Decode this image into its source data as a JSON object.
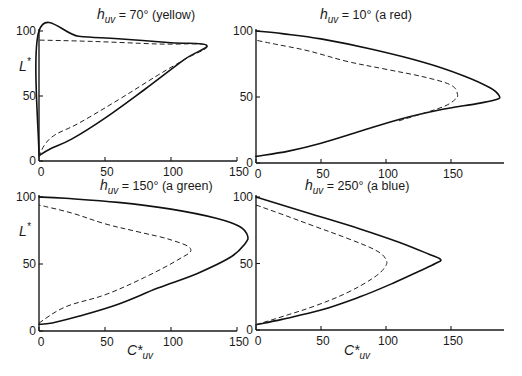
{
  "figure": {
    "panels": [
      {
        "title_symbol": "h",
        "title_sub": "uv",
        "title_rest": " = 70° (yellow)",
        "ylabel": "L",
        "ylabel_sup": "*",
        "xlabel": "",
        "xlabel_sub": ""
      },
      {
        "title_symbol": "h",
        "title_sub": "uv",
        "title_rest": " = 10° (a red)",
        "ylabel": "",
        "ylabel_sup": "",
        "xlabel": "",
        "xlabel_sub": ""
      },
      {
        "title_symbol": "h",
        "title_sub": "uv",
        "title_rest": " = 150° (a green)",
        "ylabel": "L",
        "ylabel_sup": "*",
        "xlabel": "C*",
        "xlabel_sub": "uv"
      },
      {
        "title_symbol": "h",
        "title_sub": "uv",
        "title_rest": " = 250° (a blue)",
        "ylabel": "",
        "ylabel_sup": "",
        "xlabel": "C*",
        "xlabel_sub": "uv"
      }
    ]
  },
  "chart_data": [
    {
      "type": "line",
      "title": "h_uv = 70° (yellow)",
      "xlabel": "",
      "ylabel": "L*",
      "xlim": [
        0,
        150
      ],
      "ylim": [
        0,
        100
      ],
      "xticks": [
        "0",
        "50",
        "100",
        "150"
      ],
      "yticks": [
        "0",
        "50",
        "100"
      ],
      "grid": false,
      "series": [
        {
          "name": "solid boundary",
          "style": "solid",
          "points": [
            [
              0,
              4
            ],
            [
              0,
              100
            ],
            [
              30,
              96
            ],
            [
              60,
              94
            ],
            [
              100,
              91
            ],
            [
              127,
              89
            ],
            [
              110,
              78
            ],
            [
              80,
              55
            ],
            [
              50,
              33
            ],
            [
              25,
              17
            ],
            [
              8,
              9
            ],
            [
              0,
              4
            ]
          ]
        },
        {
          "name": "dashed boundary",
          "style": "dashed",
          "points": [
            [
              0,
              3
            ],
            [
              4,
              12
            ],
            [
              12,
              20
            ],
            [
              30,
              29
            ],
            [
              60,
              47
            ],
            [
              90,
              66
            ],
            [
              110,
              78
            ],
            [
              127,
              89
            ],
            [
              90,
              90
            ],
            [
              40,
              92
            ],
            [
              0,
              93
            ]
          ]
        }
      ]
    },
    {
      "type": "line",
      "title": "h_uv = 10° (a red)",
      "xlabel": "",
      "ylabel": "",
      "xlim": [
        0,
        190
      ],
      "ylim": [
        0,
        100
      ],
      "xticks": [
        "0",
        "50",
        "100",
        "150"
      ],
      "yticks": [
        "0",
        "50",
        "100"
      ],
      "grid": false,
      "series": [
        {
          "name": "solid boundary",
          "style": "solid",
          "points": [
            [
              0,
              5
            ],
            [
              25,
              9
            ],
            [
              50,
              15
            ],
            [
              80,
              24
            ],
            [
              110,
              33
            ],
            [
              140,
              40
            ],
            [
              170,
              45
            ],
            [
              185,
              48
            ],
            [
              187,
              51
            ],
            [
              180,
              57
            ],
            [
              160,
              66
            ],
            [
              130,
              76
            ],
            [
              90,
              86
            ],
            [
              50,
              94
            ],
            [
              20,
              98
            ],
            [
              0,
              100
            ]
          ]
        },
        {
          "name": "dashed boundary",
          "style": "dashed",
          "points": [
            [
              110,
              32
            ],
            [
              130,
              38
            ],
            [
              145,
              43
            ],
            [
              153,
              48
            ],
            [
              155,
              52
            ],
            [
              150,
              59
            ],
            [
              130,
              65
            ],
            [
              100,
              71
            ],
            [
              70,
              77
            ],
            [
              40,
              85
            ],
            [
              15,
              90
            ],
            [
              0,
              93
            ]
          ]
        }
      ]
    },
    {
      "type": "line",
      "title": "h_uv = 150° (a green)",
      "xlabel": "C*_uv",
      "ylabel": "L*",
      "xlim": [
        0,
        160
      ],
      "ylim": [
        0,
        100
      ],
      "xticks": [
        "0",
        "50",
        "100",
        "150"
      ],
      "yticks": [
        "0",
        "50",
        "100"
      ],
      "grid": false,
      "series": [
        {
          "name": "solid boundary",
          "style": "solid",
          "points": [
            [
              0,
              5
            ],
            [
              10,
              6
            ],
            [
              30,
              11
            ],
            [
              60,
              20
            ],
            [
              90,
              32
            ],
            [
              120,
              43
            ],
            [
              145,
              55
            ],
            [
              156,
              65
            ],
            [
              158,
              71
            ],
            [
              152,
              78
            ],
            [
              135,
              84
            ],
            [
              100,
              91
            ],
            [
              60,
              96
            ],
            [
              20,
              99
            ],
            [
              0,
              100
            ]
          ]
        },
        {
          "name": "dashed boundary",
          "style": "dashed",
          "points": [
            [
              0,
              6
            ],
            [
              20,
              18
            ],
            [
              50,
              27
            ],
            [
              80,
              40
            ],
            [
              105,
              53
            ],
            [
              115,
              61
            ],
            [
              100,
              68
            ],
            [
              75,
              74
            ],
            [
              50,
              80
            ],
            [
              25,
              88
            ],
            [
              0,
              94
            ]
          ]
        }
      ]
    },
    {
      "type": "line",
      "title": "h_uv = 250° (a blue)",
      "xlabel": "C*_uv",
      "ylabel": "",
      "xlim": [
        0,
        190
      ],
      "ylim": [
        0,
        100
      ],
      "xticks": [
        "0",
        "50",
        "100",
        "150"
      ],
      "yticks": [
        "0",
        "50",
        "100"
      ],
      "grid": false,
      "series": [
        {
          "name": "solid boundary",
          "style": "solid",
          "points": [
            [
              0,
              4
            ],
            [
              20,
              8
            ],
            [
              50,
              15
            ],
            [
              80,
              25
            ],
            [
              105,
              35
            ],
            [
              125,
              44
            ],
            [
              138,
              50
            ],
            [
              142,
              53
            ],
            [
              133,
              57
            ],
            [
              110,
              66
            ],
            [
              80,
              76
            ],
            [
              40,
              88
            ],
            [
              0,
              100
            ]
          ]
        },
        {
          "name": "dashed boundary",
          "style": "dashed",
          "points": [
            [
              0,
              4
            ],
            [
              20,
              10
            ],
            [
              45,
              18
            ],
            [
              70,
              28
            ],
            [
              90,
              39
            ],
            [
              99,
              47
            ],
            [
              100,
              53
            ],
            [
              92,
              60
            ],
            [
              70,
              69
            ],
            [
              45,
              78
            ],
            [
              20,
              87
            ],
            [
              0,
              94
            ]
          ]
        }
      ]
    }
  ]
}
